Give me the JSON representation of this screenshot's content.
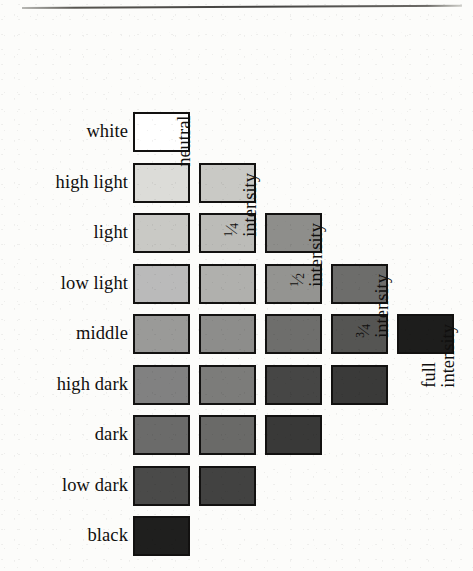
{
  "figure": {
    "background_color": "#fcfcfa",
    "rule_color": "#434240"
  },
  "rows": [
    {
      "label": "white",
      "count": 1
    },
    {
      "label": "high light",
      "count": 2
    },
    {
      "label": "light",
      "count": 3
    },
    {
      "label": "low light",
      "count": 4
    },
    {
      "label": "middle",
      "count": 5
    },
    {
      "label": "high dark",
      "count": 4
    },
    {
      "label": "dark",
      "count": 3
    },
    {
      "label": "low dark",
      "count": 2
    },
    {
      "label": "black",
      "count": 1
    }
  ],
  "columns": [
    {
      "id": "neutral",
      "lines": [
        "neutral"
      ],
      "fraction": null
    },
    {
      "id": "quarter",
      "lines": [
        "intensity"
      ],
      "fraction": "1/4"
    },
    {
      "id": "half",
      "lines": [
        "intensity"
      ],
      "fraction": "1/2"
    },
    {
      "id": "three-quarter",
      "lines": [
        "intensity"
      ],
      "fraction": "3/4"
    },
    {
      "id": "full",
      "lines": [
        "full",
        "intensity"
      ],
      "fraction": null
    }
  ],
  "chart_data": {
    "type": "heatmap",
    "xlabel": "intensity",
    "ylabel": "value",
    "categories_x": [
      "neutral",
      "1/4 intensity",
      "1/2 intensity",
      "3/4 intensity",
      "full intensity"
    ],
    "categories_y": [
      "white",
      "high light",
      "light",
      "low light",
      "middle",
      "high dark",
      "dark",
      "low dark",
      "black"
    ],
    "grid": false,
    "legend": "none",
    "note": "Triangular / diamond arrangement: number of swatches per value row is 1,2,3,4,5,4,3,2,1 from white down to black.",
    "cells": [
      {
        "row": "white",
        "col": "neutral",
        "color": "#ffffff"
      },
      {
        "row": "high light",
        "col": "neutral",
        "color": "#dcdcd8"
      },
      {
        "row": "high light",
        "col": "1/4 intensity",
        "color": "#c9c9c5"
      },
      {
        "row": "light",
        "col": "neutral",
        "color": "#c9c9c5"
      },
      {
        "row": "light",
        "col": "1/4 intensity",
        "color": "#bcbcb8"
      },
      {
        "row": "light",
        "col": "1/2 intensity",
        "color": "#8e8e8b"
      },
      {
        "row": "low light",
        "col": "neutral",
        "color": "#bababa"
      },
      {
        "row": "low light",
        "col": "1/4 intensity",
        "color": "#b0b0ad"
      },
      {
        "row": "low light",
        "col": "1/2 intensity",
        "color": "#949491"
      },
      {
        "row": "low light",
        "col": "3/4 intensity",
        "color": "#6d6d6b"
      },
      {
        "row": "middle",
        "col": "neutral",
        "color": "#9a9a98"
      },
      {
        "row": "middle",
        "col": "1/4 intensity",
        "color": "#8d8d8b"
      },
      {
        "row": "middle",
        "col": "1/2 intensity",
        "color": "#6e6e6c"
      },
      {
        "row": "middle",
        "col": "3/4 intensity",
        "color": "#555553"
      },
      {
        "row": "middle",
        "col": "full intensity",
        "color": "#1d1d1c"
      },
      {
        "row": "high dark",
        "col": "neutral",
        "color": "#818181"
      },
      {
        "row": "high dark",
        "col": "1/4 intensity",
        "color": "#7c7c7a"
      },
      {
        "row": "high dark",
        "col": "1/2 intensity",
        "color": "#464645"
      },
      {
        "row": "high dark",
        "col": "3/4 intensity",
        "color": "#3a3a39"
      },
      {
        "row": "dark",
        "col": "neutral",
        "color": "#6b6b6a"
      },
      {
        "row": "dark",
        "col": "1/4 intensity",
        "color": "#6a6a68"
      },
      {
        "row": "dark",
        "col": "1/2 intensity",
        "color": "#393938"
      },
      {
        "row": "low dark",
        "col": "neutral",
        "color": "#4a4a49"
      },
      {
        "row": "low dark",
        "col": "1/4 intensity",
        "color": "#424241"
      },
      {
        "row": "black",
        "col": "neutral",
        "color": "#1f1f1e"
      }
    ]
  },
  "geometry": {
    "grid_left": 133,
    "grid_top": 112,
    "col_pitch": 66,
    "row_pitch": 50.5,
    "swatch_w": 57,
    "swatch_h": 40,
    "label_right": 128
  }
}
